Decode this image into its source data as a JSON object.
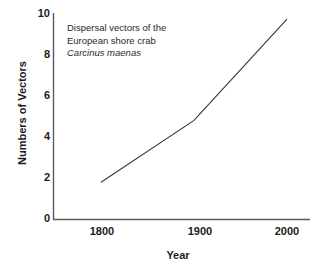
{
  "chart_data": {
    "type": "line",
    "title": "",
    "xlabel": "Year",
    "ylabel": "Numbers of Vectors",
    "x": [
      1800,
      1900,
      2000
    ],
    "values": [
      1.8,
      4.8,
      9.7
    ],
    "series": [
      {
        "name": "Dispersal vectors of Carcinus maenas",
        "values": [
          1.8,
          4.8,
          9.7
        ]
      }
    ],
    "categories": [
      "1800",
      "1900",
      "2000"
    ],
    "xlim": [
      1750,
      2050
    ],
    "ylim": [
      0,
      10
    ],
    "xticks": [
      "1800",
      "1900",
      "2000"
    ],
    "yticks": [
      "0",
      "2",
      "4",
      "6",
      "8",
      "10"
    ],
    "grid": false,
    "legend": false,
    "legend_position": "none",
    "annotations": [
      "Dispersal vectors of the",
      "European shore crab",
      "Carcinus maenas"
    ],
    "line_color": "#3c3c3c",
    "axis_color": "#555555",
    "background_color": "#ffffff"
  },
  "axes": {
    "y_title": "Numbers of Vectors",
    "x_title": "Year",
    "y_tick_labels": [
      "10",
      "8",
      "6",
      "4",
      "2",
      "0"
    ],
    "x_tick_labels": [
      "1800",
      "1900",
      "2000"
    ]
  },
  "annotation": {
    "line1": "Dispersal vectors of the",
    "line2": "European shore crab",
    "line3": "Carcinus maenas"
  }
}
